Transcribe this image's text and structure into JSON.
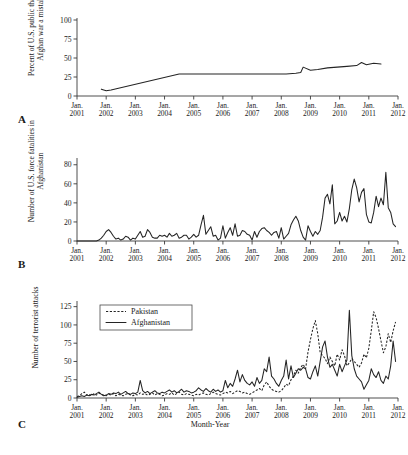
{
  "figure": {
    "xlabel": "Month-Year",
    "panel_letters": [
      "A",
      "B",
      "C"
    ]
  },
  "chart_data": [
    {
      "panel": "A",
      "type": "line",
      "title": "",
      "ylabel": "Percent of U.S. public that finds Afghan war a mistake",
      "xlabel": "",
      "ylim": [
        0,
        100
      ],
      "yticks": [
        0,
        25,
        50,
        75,
        100
      ],
      "xticks": [
        "Jan. 2001",
        "Jan. 2002",
        "Jan. 2003",
        "Jan. 2004",
        "Jan. 2005",
        "Jan. 2006",
        "Jan. 2007",
        "Jan. 2008",
        "Jan. 2009",
        "Jan. 2010",
        "Jan. 2011",
        "Jan. 2012"
      ],
      "xlim": [
        "2001-01",
        "2012-01"
      ],
      "grid": false,
      "legend": null,
      "series": [
        {
          "name": "Percent finds Afghan war a mistake",
          "style": "solid",
          "x": [
            "2001-11",
            "2002-01",
            "2002-03",
            "2004-07",
            "2005-06",
            "2006-06",
            "2007-06",
            "2008-03",
            "2008-07",
            "2008-09",
            "2008-10",
            "2009-01",
            "2009-04",
            "2009-08",
            "2009-12",
            "2010-04",
            "2010-08",
            "2010-10",
            "2010-12",
            "2011-03",
            "2011-06"
          ],
          "values": [
            9,
            7,
            8,
            29,
            29,
            29,
            29,
            29,
            30,
            31,
            38,
            34,
            35,
            37,
            38,
            39,
            40,
            44,
            41,
            43,
            42
          ]
        }
      ]
    },
    {
      "panel": "B",
      "type": "line",
      "title": "",
      "ylabel": "Number of U.S. force fatalities in Afghanistan",
      "xlabel": "",
      "ylim": [
        0,
        85
      ],
      "yticks": [
        0,
        20,
        40,
        60,
        80
      ],
      "xticks": [
        "Jan. 2001",
        "Jan. 2002",
        "Jan. 2003",
        "Jan. 2004",
        "Jan. 2005",
        "Jan. 2006",
        "Jan. 2007",
        "Jan. 2008",
        "Jan. 2009",
        "Jan. 2010",
        "Jan. 2011",
        "Jan. 2012"
      ],
      "xlim": [
        "2001-01",
        "2012-01"
      ],
      "grid": false,
      "legend": null,
      "series": [
        {
          "name": "U.S. force fatalities in Afghanistan",
          "style": "solid",
          "start": "2001-01",
          "values": [
            0,
            0,
            0,
            0,
            0,
            0,
            0,
            0,
            0,
            1,
            3,
            6,
            10,
            12,
            9,
            5,
            2,
            3,
            1,
            2,
            5,
            4,
            1,
            3,
            2,
            6,
            10,
            4,
            5,
            12,
            9,
            4,
            3,
            3,
            6,
            5,
            6,
            4,
            8,
            5,
            6,
            8,
            3,
            4,
            6,
            6,
            2,
            4,
            7,
            4,
            6,
            17,
            27,
            7,
            11,
            15,
            5,
            6,
            1,
            3,
            16,
            3,
            9,
            14,
            6,
            18,
            5,
            6,
            11,
            10,
            7,
            6,
            1,
            10,
            4,
            10,
            13,
            14,
            11,
            9,
            6,
            9,
            10,
            3,
            14,
            2,
            5,
            8,
            17,
            22,
            26,
            21,
            11,
            4,
            1,
            16,
            10,
            5,
            10,
            7,
            11,
            25,
            45,
            49,
            39,
            59,
            18,
            21,
            30,
            21,
            26,
            20,
            34,
            54,
            65,
            56,
            41,
            51,
            55,
            28,
            20,
            19,
            30,
            47,
            36,
            45,
            38,
            72,
            35,
            30,
            18,
            15
          ]
        }
      ]
    },
    {
      "panel": "C",
      "type": "line",
      "title": "",
      "ylabel": "Number of terrorist attacks",
      "xlabel": "Month-Year",
      "ylim": [
        0,
        130
      ],
      "yticks": [
        0,
        25,
        50,
        75,
        100,
        125
      ],
      "xticks": [
        "Jan. 2001",
        "Jan. 2002",
        "Jan. 2003",
        "Jan. 2004",
        "Jan. 2005",
        "Jan. 2006",
        "Jan. 2007",
        "Jan. 2008",
        "Jan. 2009",
        "Jan. 2010",
        "Jan. 2011",
        "Jan. 2012"
      ],
      "xlim": [
        "2001-01",
        "2012-01"
      ],
      "grid": false,
      "legend": {
        "position": "upper left",
        "entries": [
          {
            "label": "Pakistan",
            "style": "dashed"
          },
          {
            "label": "Afghanistan",
            "style": "solid"
          }
        ]
      },
      "series": [
        {
          "name": "Pakistan",
          "style": "dashed",
          "start": "2001-01",
          "values": [
            2,
            3,
            6,
            8,
            4,
            5,
            3,
            6,
            4,
            7,
            5,
            4,
            3,
            5,
            4,
            6,
            3,
            5,
            4,
            3,
            5,
            6,
            4,
            3,
            5,
            4,
            7,
            5,
            6,
            4,
            5,
            7,
            4,
            6,
            5,
            3,
            4,
            6,
            5,
            7,
            4,
            6,
            8,
            5,
            4,
            6,
            5,
            4,
            3,
            5,
            4,
            6,
            7,
            5,
            4,
            6,
            8,
            6,
            5,
            4,
            6,
            8,
            7,
            9,
            6,
            8,
            10,
            9,
            7,
            8,
            6,
            5,
            7,
            9,
            11,
            13,
            10,
            18,
            22,
            16,
            12,
            10,
            9,
            8,
            10,
            14,
            19,
            17,
            25,
            30,
            38,
            34,
            42,
            46,
            40,
            63,
            80,
            95,
            106,
            88,
            62,
            58,
            54,
            47,
            56,
            50,
            44,
            60,
            52,
            66,
            58,
            44,
            48,
            54,
            50,
            46,
            42,
            48,
            60,
            55,
            68,
            92,
            118,
            110,
            95,
            78,
            62,
            70,
            88,
            76,
            92,
            104
          ]
        },
        {
          "name": "Afghanistan",
          "style": "solid",
          "start": "2001-01",
          "values": [
            1,
            2,
            3,
            2,
            4,
            3,
            5,
            4,
            6,
            8,
            5,
            3,
            4,
            6,
            5,
            7,
            6,
            8,
            5,
            7,
            9,
            6,
            5,
            7,
            6,
            8,
            24,
            10,
            7,
            9,
            6,
            8,
            10,
            7,
            6,
            8,
            7,
            9,
            11,
            8,
            10,
            7,
            9,
            12,
            8,
            10,
            9,
            7,
            8,
            10,
            14,
            11,
            9,
            13,
            10,
            8,
            12,
            9,
            11,
            8,
            10,
            24,
            14,
            20,
            16,
            26,
            38,
            22,
            32,
            24,
            20,
            18,
            22,
            16,
            28,
            20,
            24,
            40,
            36,
            56,
            30,
            26,
            20,
            16,
            24,
            30,
            52,
            26,
            44,
            28,
            34,
            40,
            38,
            42,
            40,
            28,
            26,
            36,
            44,
            30,
            50,
            70,
            78,
            56,
            42,
            46,
            38,
            30,
            46,
            36,
            44,
            52,
            120,
            58,
            40,
            30,
            26,
            22,
            12,
            18,
            24,
            40,
            32,
            28,
            36,
            24,
            20,
            30,
            26,
            44,
            78,
            50
          ]
        }
      ]
    }
  ]
}
